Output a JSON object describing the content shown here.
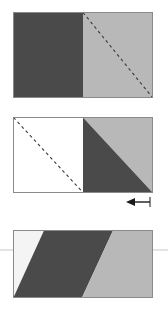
{
  "figure": {
    "width": 168,
    "height": 309,
    "background": "#ffffff",
    "panel_count": 3
  },
  "colors": {
    "dark_gray": "#4a4a4a",
    "light_gray": "#b8b8b8",
    "white": "#ffffff",
    "near_white": "#f4f4f4",
    "outline": "#8a8a8a",
    "dashed_line": "#3a3a3a",
    "arrow": "#1a1a1a",
    "guide_line": "#c9c9c9"
  },
  "panels": [
    {
      "id": "panel-1",
      "name": "rectangle-split-vertically",
      "x": 13,
      "y": 12,
      "width": 139,
      "height": 85,
      "regions": [
        {
          "name": "left-half-dark",
          "shape": "rectangle",
          "fill": "#4a4a4a",
          "points": "0,0 69.5,0 69.5,85 0,85"
        },
        {
          "name": "right-half-light",
          "shape": "rectangle",
          "fill": "#b8b8b8",
          "points": "69.5,0 139,0 139,85 69.5,85"
        }
      ],
      "dashed_diagonal": {
        "name": "dashed-diagonal-right-half",
        "x1": 69.5,
        "y1": 0,
        "x2": 139,
        "y2": 85,
        "dash": "3 3"
      }
    },
    {
      "id": "panel-2",
      "name": "rectangle-with-diagonal-split-right",
      "x": 13,
      "y": 117,
      "width": 139,
      "height": 75,
      "regions": [
        {
          "name": "left-half-white",
          "shape": "rectangle",
          "fill": "#ffffff",
          "points": "0,0 69.5,0 69.5,75 0,75"
        },
        {
          "name": "right-lower-triangle-dark",
          "shape": "triangle",
          "fill": "#4a4a4a",
          "points": "69.5,0 139,75 69.5,75"
        },
        {
          "name": "right-upper-triangle-light",
          "shape": "triangle",
          "fill": "#b8b8b8",
          "points": "69.5,0 139,0 139,75"
        }
      ],
      "dashed_diagonal": {
        "name": "dashed-diagonal-left-half",
        "x1": 0,
        "y1": 0,
        "x2": 69.5,
        "y2": 75,
        "dash": "3 3"
      }
    },
    {
      "id": "panel-3",
      "name": "sheared-parallelograms",
      "x": 13,
      "y": 230,
      "width": 139,
      "height": 67,
      "shear_offset": 38,
      "regions": [
        {
          "name": "left-parallelogram-white",
          "shape": "polygon",
          "fill": "#f4f4f4",
          "points": "0,67 0,67 31,0 0,67"
        },
        {
          "name": "center-parallelogram-dark",
          "shape": "polygon",
          "fill": "#4a4a4a",
          "points": "31,0 100,0 69,67 0,67"
        },
        {
          "name": "right-parallelogram-light",
          "shape": "polygon",
          "fill": "#b8b8b8",
          "points": "100,0 139,0 139,67 69,67"
        }
      ]
    }
  ],
  "arrow": {
    "name": "left-pointing-arrow",
    "direction": "left",
    "x": 127,
    "y": 197,
    "length": 22,
    "label": ""
  },
  "guide_line": {
    "name": "horizontal-guide-line",
    "y": 250,
    "x1": 0,
    "x2": 168
  }
}
